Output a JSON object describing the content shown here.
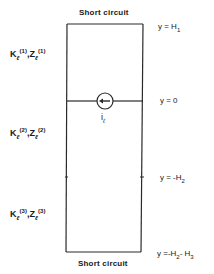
{
  "diagram": {
    "top_boundary": "Short circuit",
    "bottom_boundary": "Short circuit",
    "source_label": {
      "base": "i",
      "sub": "ℓ"
    },
    "interfaces": [
      {
        "id": "top",
        "text": "y = H",
        "sub": "1"
      },
      {
        "id": "source",
        "text": "y = 0",
        "sub": ""
      },
      {
        "id": "mid",
        "text": "y = -H",
        "sub": "2"
      },
      {
        "id": "bottom",
        "text": "y =-H",
        "sub": "2",
        "tail": "- H",
        "tail_sub": "3"
      }
    ],
    "layers": [
      {
        "k": "K",
        "k_sub": "ℓ",
        "k_sup": "(1)",
        "sep": ",",
        "z": "Z",
        "z_sub": "ℓ",
        "z_sup": "(1)"
      },
      {
        "k": "K",
        "k_sub": "ℓ",
        "k_sup": "(2)",
        "sep": ",",
        "z": "Z",
        "z_sub": "ℓ",
        "z_sup": "(2)"
      },
      {
        "k": "K",
        "k_sub": "ℓ",
        "k_sup": "(3)",
        "sep": ",",
        "z": "Z",
        "z_sub": "ℓ",
        "z_sup": "(3)"
      }
    ],
    "source_icon": "current-source-arrow-left-icon",
    "line_color": "#2a2a2a"
  }
}
